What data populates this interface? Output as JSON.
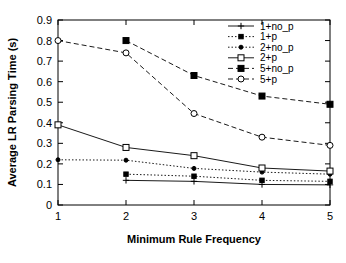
{
  "chart_data": {
    "type": "line",
    "title": "",
    "xlabel": "Minimum Rule Frequency",
    "ylabel": "Average LR Parsing Time (s)",
    "xlim": [
      1,
      5
    ],
    "ylim": [
      0,
      0.9
    ],
    "xticks": [
      "1",
      "2",
      "3",
      "4",
      "5"
    ],
    "yticks": [
      "0",
      "0.1",
      "0.2",
      "0.3",
      "0.4",
      "0.5",
      "0.6",
      "0.7",
      "0.8",
      "0.9"
    ],
    "grid": false,
    "legend_position": "top-right-inside",
    "x": [
      1,
      2,
      3,
      4,
      5
    ],
    "series": [
      {
        "name": "1+no_p",
        "marker": "plus",
        "dash": "solid",
        "x": [
          2,
          3,
          4,
          5
        ],
        "values": [
          0.12,
          0.115,
          0.1,
          0.098
        ]
      },
      {
        "name": "1+p",
        "marker": "filled-square-small",
        "dash": "dotted",
        "x": [
          2,
          3,
          4,
          5
        ],
        "values": [
          0.15,
          0.14,
          0.12,
          0.115
        ]
      },
      {
        "name": "2+no_p",
        "marker": "filled-dot",
        "dash": "dotted",
        "x": [
          1,
          2,
          3,
          4,
          5
        ],
        "values": [
          0.22,
          0.218,
          0.178,
          0.16,
          0.15
        ]
      },
      {
        "name": "2+p",
        "marker": "open-square",
        "dash": "solid",
        "x": [
          1,
          2,
          3,
          4,
          5
        ],
        "values": [
          0.39,
          0.28,
          0.24,
          0.18,
          0.165
        ]
      },
      {
        "name": "5+no_p",
        "marker": "filled-square",
        "dash": "dashed",
        "x": [
          2,
          3,
          4,
          5
        ],
        "values": [
          0.8,
          0.63,
          0.53,
          0.49
        ]
      },
      {
        "name": "5+p",
        "marker": "open-circle",
        "dash": "dashed",
        "x": [
          1,
          2,
          3,
          4,
          5
        ],
        "values": [
          0.8,
          0.74,
          0.445,
          0.33,
          0.29
        ]
      }
    ]
  },
  "legend": {
    "entries": [
      {
        "label": "1+no_p"
      },
      {
        "label": "1+p"
      },
      {
        "label": "2+no_p"
      },
      {
        "label": "2+p"
      },
      {
        "label": "5+no_p"
      },
      {
        "label": "5+p"
      }
    ]
  },
  "colors": {
    "axis": "#000000",
    "background": "#ffffff",
    "series": "#000000"
  }
}
